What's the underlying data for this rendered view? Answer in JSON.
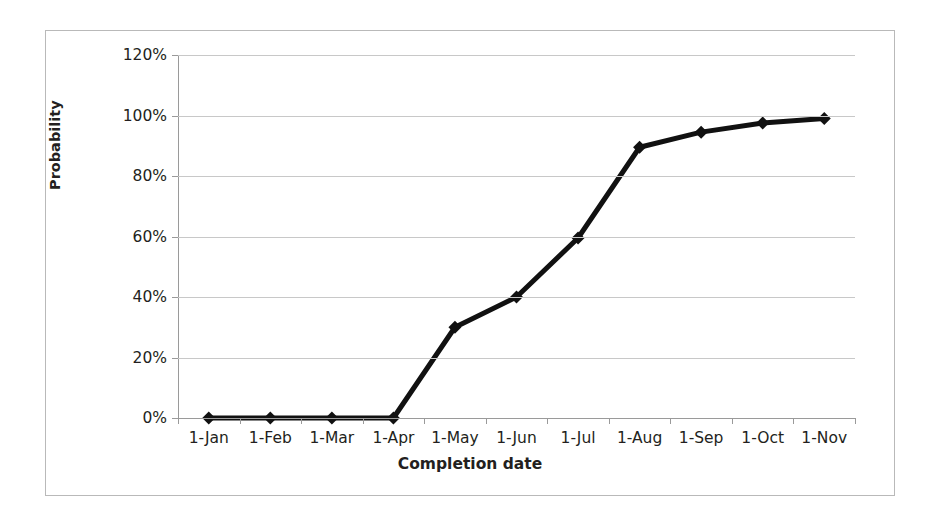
{
  "chart_data": {
    "type": "line",
    "title": "",
    "xlabel": "Completion date",
    "ylabel": "Probability",
    "categories": [
      "1-Jan",
      "1-Feb",
      "1-Mar",
      "1-Apr",
      "1-May",
      "1-Jun",
      "1-Jul",
      "1-Aug",
      "1-Sep",
      "1-Oct",
      "1-Nov"
    ],
    "values": [
      0,
      0,
      0,
      0,
      30,
      40,
      59.5,
      89.5,
      94.5,
      97.5,
      99
    ],
    "value_labels": [
      "0%",
      "0%",
      "0%",
      "0%",
      "30%",
      "40%",
      "59.5%",
      "89.5%",
      "94.5%",
      "97.5%",
      "99%"
    ],
    "ytick_labels": [
      "0%",
      "20%",
      "40%",
      "60%",
      "80%",
      "100%",
      "120%"
    ],
    "ytick_values": [
      0,
      20,
      40,
      60,
      80,
      100,
      120
    ],
    "ylim": [
      0,
      120
    ],
    "grid": "horizontal",
    "legend": "none",
    "series_color": "#111111",
    "gridline_color": "#c8c8c8",
    "axis_color": "#9a9a9a",
    "marker": "diamond",
    "line_width": 5
  }
}
